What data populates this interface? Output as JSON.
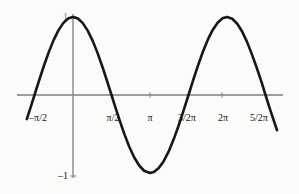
{
  "figure": {
    "width": 299,
    "height": 194,
    "background_color": "#fbfbfa",
    "curve_color": "#171717",
    "axis_color": "#7e7e7e",
    "text_color": "#161616"
  },
  "chart_data": {
    "type": "line",
    "title": "",
    "subtitle": "",
    "xlabel": "",
    "ylabel": "",
    "function": "y = cos(x)",
    "grid": false,
    "legend": null,
    "xlim": [
      -1.885,
      8.325
    ],
    "ylim": [
      -1.32,
      1.28
    ],
    "axis_origin": {
      "x": 0,
      "y": 0
    },
    "x_tick_values": [
      -1.5708,
      1.5708,
      3.1416,
      4.7124,
      6.2832,
      7.854
    ],
    "x_tick_labels": [
      "–π/2",
      "π/2",
      "π",
      "3/2π",
      "2π",
      "5/2π"
    ],
    "y_tick_values": [
      1,
      -1
    ],
    "y_tick_labels": [
      "1",
      "–1"
    ],
    "x": [
      -1.885,
      -1.7,
      -1.5708,
      -1.4,
      -1.2,
      -1.0,
      -0.8,
      -0.6,
      -0.4,
      -0.2,
      0.0,
      0.2,
      0.4,
      0.6,
      0.8,
      1.0,
      1.2,
      1.4,
      1.5708,
      1.7,
      1.9,
      2.1,
      2.3,
      2.5,
      2.7,
      2.9,
      3.1416,
      3.3,
      3.5,
      3.7,
      3.9,
      4.1,
      4.3,
      4.5,
      4.7124,
      4.9,
      5.1,
      5.3,
      5.5,
      5.7,
      5.9,
      6.1,
      6.2832,
      6.5,
      6.7,
      6.9,
      7.1,
      7.3,
      7.5,
      7.7,
      7.854,
      8.05,
      8.325
    ],
    "y": [
      -0.309,
      -0.129,
      0.0,
      0.17,
      0.362,
      0.54,
      0.697,
      0.825,
      0.921,
      0.98,
      1.0,
      0.98,
      0.921,
      0.825,
      0.697,
      0.54,
      0.362,
      0.17,
      0.0,
      -0.129,
      -0.323,
      -0.505,
      -0.666,
      -0.801,
      -0.904,
      -0.971,
      -1.0,
      -0.987,
      -0.936,
      -0.848,
      -0.726,
      -0.575,
      -0.401,
      -0.211,
      0.0,
      0.187,
      0.378,
      0.554,
      0.709,
      0.834,
      0.927,
      0.983,
      1.0,
      0.977,
      0.914,
      0.814,
      0.681,
      0.521,
      0.346,
      0.159,
      0.0,
      -0.194,
      -0.452
    ],
    "series": [
      {
        "name": "cos(x)",
        "color": "#171717",
        "line_width": 2.6,
        "style": "solid"
      }
    ]
  },
  "ticks": {
    "x": [
      {
        "name": "neg-half-pi",
        "label": "–π/2",
        "px": 40,
        "label_px": 38,
        "label_py": 118,
        "has_mark": false
      },
      {
        "name": "half-pi",
        "label": "π/2",
        "px": 113,
        "label_px": 113,
        "label_py": 118,
        "has_mark": false
      },
      {
        "name": "pi",
        "label": "π",
        "px": 150,
        "label_px": 150,
        "label_py": 118,
        "has_mark": true
      },
      {
        "name": "three-halves-pi",
        "label": "3/2π",
        "px": 186,
        "label_px": 187,
        "label_py": 118,
        "has_mark": false
      },
      {
        "name": "two-pi",
        "label": "2π",
        "px": 222,
        "label_px": 223,
        "label_py": 118,
        "has_mark": true
      },
      {
        "name": "five-halves-pi",
        "label": "5/2π",
        "px": 258,
        "label_px": 259,
        "label_py": 118,
        "has_mark": false
      }
    ],
    "y": [
      {
        "name": "y-one",
        "label": "1",
        "py": 17,
        "label_px": 68,
        "label_py": 17,
        "has_mark": true
      },
      {
        "name": "y-neg-one",
        "label": "–1",
        "py": 176,
        "label_px": 68,
        "label_py": 176,
        "has_mark": true
      }
    ]
  },
  "axes": {
    "x_axis": {
      "x1": 17,
      "y1": 95,
      "x2": 283,
      "y2": 95
    },
    "y_axis": {
      "x1": 73,
      "y1": 14,
      "x2": 73,
      "y2": 178
    }
  }
}
